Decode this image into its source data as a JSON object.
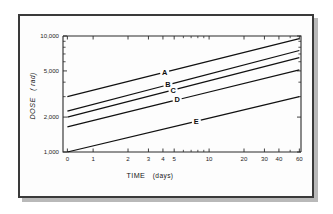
{
  "chart_data": {
    "type": "line",
    "title": "",
    "xlabel": "TIME",
    "xlabel_unit": "(days)",
    "ylabel": "DOSE",
    "ylabel_unit": "( rad)",
    "xscale": "log",
    "yscale": "log",
    "xlim": [
      0.55,
      62
    ],
    "ylim": [
      1000,
      10000
    ],
    "grid": false,
    "legend_position": "inline-labels-on-lines",
    "x_ticks": [
      {
        "value": 0.6,
        "label": "0"
      },
      {
        "value": 1,
        "label": "1"
      },
      {
        "value": 2,
        "label": "2"
      },
      {
        "value": 3,
        "label": "3"
      },
      {
        "value": 4,
        "label": "4"
      },
      {
        "value": 5,
        "label": "5"
      },
      {
        "value": 10,
        "label": "10"
      },
      {
        "value": 20,
        "label": "20"
      },
      {
        "value": 30,
        "label": "30"
      },
      {
        "value": 40,
        "label": "40"
      },
      {
        "value": 60,
        "label": "60"
      }
    ],
    "x_minor_ticks": [
      6,
      7,
      8,
      9,
      50
    ],
    "y_ticks": [
      {
        "value": 1000,
        "label": "1,000"
      },
      {
        "value": 2000,
        "label": "2,000"
      },
      {
        "value": 5000,
        "label": "5,000"
      },
      {
        "value": 10000,
        "label": "10,000"
      }
    ],
    "y_minor_ticks": [
      3000,
      4000,
      6000,
      7000,
      8000,
      9000
    ],
    "series": [
      {
        "name": "A",
        "label": "A",
        "x": [
          0.6,
          60
        ],
        "y": [
          3000,
          9500
        ],
        "label_x": 4.1,
        "label_y": 5050
      },
      {
        "name": "B",
        "label": "B",
        "x": [
          0.6,
          60
        ],
        "y": [
          2250,
          7500
        ],
        "label_x": 4.4,
        "label_y": 3870
      },
      {
        "name": "C",
        "label": "C",
        "x": [
          0.6,
          60
        ],
        "y": [
          2000,
          6500
        ],
        "label_x": 4.9,
        "label_y": 3400
      },
      {
        "name": "D",
        "label": "D",
        "x": [
          0.6,
          60
        ],
        "y": [
          1650,
          5100
        ],
        "label_x": 5.3,
        "label_y": 2830
      },
      {
        "name": "E",
        "label": "E",
        "x": [
          0.6,
          60
        ],
        "y": [
          1000,
          3000
        ],
        "label_x": 7.6,
        "label_y": 2010
      }
    ],
    "colors": {
      "line": "#111111",
      "axis": "#2b2b2b",
      "frame": "#3a3a3a",
      "background": "#ffffff"
    }
  }
}
